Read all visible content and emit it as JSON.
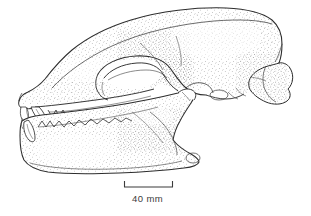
{
  "figure": {
    "illustration_type": "stipple and line drawing",
    "view": "left lateral",
    "line_color": "#ララ",
    "colors": {
      "ink": "#2b2b2b",
      "stipple": "#555555",
      "background": "#ffffff"
    }
  },
  "scale_bar": {
    "label": "40 mm",
    "length_mm": 40,
    "pixel_length": 49,
    "x_start": 124,
    "x_end": 173,
    "baseline_y": 187,
    "tick_height": 6,
    "tick_direction": "up"
  },
  "anatomy": {
    "parts": [
      "cranium",
      "sagittal crest",
      "frontal region",
      "orbit",
      "zygomatic arch",
      "rostrum",
      "nasal aperture",
      "upper incisors",
      "upper canine",
      "upper premolars",
      "upper molars",
      "mandible",
      "lower incisors",
      "lower canine",
      "lower premolars",
      "lower molars",
      "coronoid process",
      "mandibular condyle",
      "angular process",
      "braincase",
      "occipital condyle",
      "auditory bulla"
    ]
  },
  "annotations": {
    "text_items": [
      "40 mm"
    ]
  }
}
